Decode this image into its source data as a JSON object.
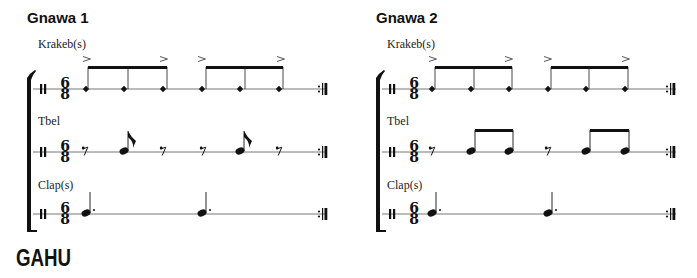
{
  "systems": [
    {
      "title": "Gnawa 1",
      "time_signature": {
        "top": "6",
        "bottom": "8"
      },
      "parts": [
        {
          "name": "Krakeb(s)",
          "notation": "two beamed groups of three x-notes, accents on beats 1 and 3 of each group"
        },
        {
          "name": "Tbel",
          "notation": "eighth rest, eighth note, eighth rest, eighth rest, eighth note, eighth rest"
        },
        {
          "name": "Clap(s)",
          "notation": "dotted quarter, dotted quarter"
        }
      ]
    },
    {
      "title": "Gnawa 2",
      "time_signature": {
        "top": "6",
        "bottom": "8"
      },
      "parts": [
        {
          "name": "Krakeb(s)",
          "notation": "two beamed groups of three x-notes, accents on beats 1 and 3 of each group"
        },
        {
          "name": "Tbel",
          "notation": "eighth rest, two beamed eighths, eighth rest, two beamed eighths"
        },
        {
          "name": "Clap(s)",
          "notation": "dotted quarter, dotted quarter"
        }
      ]
    }
  ],
  "next_section": "GAHU",
  "colors": {
    "ink": "#111111",
    "staff": "#777777"
  }
}
